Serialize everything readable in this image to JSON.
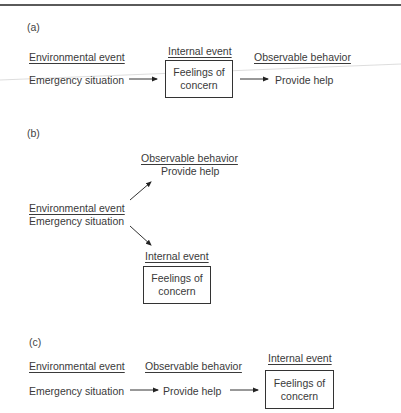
{
  "header": {
    "fragment": "· · · |"
  },
  "panels": [
    {
      "tag": "(a)",
      "environmental_heading": "Environmental event",
      "environmental_value": "Emergency situation",
      "internal_heading": "Internal event",
      "internal_value_line1": "Feelings of",
      "internal_value_line2": "concern",
      "observable_heading": "Observable behavior",
      "observable_value": "Provide help",
      "sequence": [
        "Environmental event",
        "Internal event",
        "Observable behavior"
      ]
    },
    {
      "tag": "(b)",
      "environmental_heading": "Environmental event",
      "environmental_value": "Emergency situation",
      "observable_heading": "Observable behavior",
      "observable_value": "Provide help",
      "internal_heading": "Internal event",
      "internal_value_line1": "Feelings of",
      "internal_value_line2": "concern",
      "sequence": [
        "Environmental event",
        "Observable behavior + Internal event (parallel)"
      ]
    },
    {
      "tag": "(c)",
      "environmental_heading": "Environmental event",
      "environmental_value": "Emergency situation",
      "observable_heading": "Observable behavior",
      "observable_value": "Provide help",
      "internal_heading": "Internal event",
      "internal_value_line1": "Feelings of",
      "internal_value_line2": "concern",
      "sequence": [
        "Environmental event",
        "Observable behavior",
        "Internal event"
      ]
    }
  ],
  "colors": {
    "text": "#3a3a3a",
    "box_border": "#333333",
    "rule": "#5a5a5a"
  }
}
